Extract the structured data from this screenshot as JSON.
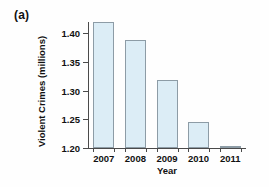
{
  "figure": {
    "panel_label": "(a)"
  },
  "chart_data": {
    "type": "bar",
    "title": "",
    "xlabel": "Year",
    "ylabel": "Violent Crimes (millions)",
    "categories": [
      "2007",
      "2008",
      "2009",
      "2010",
      "2011"
    ],
    "values": [
      1.42,
      1.388,
      1.318,
      1.245,
      1.203
    ],
    "ylim": [
      1.2,
      1.42
    ],
    "yticks": [
      1.2,
      1.25,
      1.3,
      1.35,
      1.4
    ],
    "ytick_labels": [
      "1.20",
      "1.25",
      "1.30",
      "1.35",
      "1.40"
    ],
    "grid": false,
    "legend": null,
    "bar_fill_color": "#dcedf6",
    "bar_border_color": "#8d9ca6",
    "axis_color": "#4a4a4a"
  }
}
